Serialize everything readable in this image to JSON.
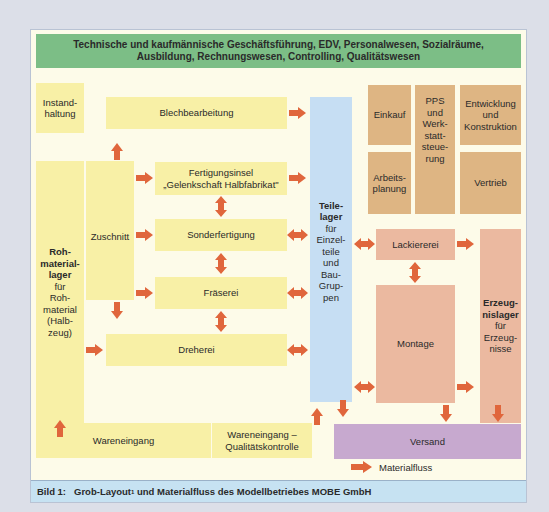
{
  "header": {
    "line1": "Technische und kaufmännische Geschäftsführung, EDV, Personalwesen, Sozialräume,",
    "line2": "Ausbildung, Rechnungswesen, Controlling, Qualitätswesen"
  },
  "boxes": {
    "instandhaltung": "Instand-\nhaltung",
    "blechbearbeitung": "Blechbearbeitung",
    "fertigungsinsel_1": "Fertigungsinsel",
    "fertigungsinsel_2": "„Gelenkschaft Halbfabrikat\"",
    "zuschnitt": "Zuschnitt",
    "sonderfertigung": "Sonderfertigung",
    "fraeserei": "Fräserei",
    "dreherei": "Dreherei",
    "rohmateriallager_bold": "Roh-\nmaterial-\nlager",
    "rohmateriallager_rest": "für\nRoh-\nmaterial\n(Halb-\nzeug)",
    "teilelager_bold": "Teile-\nlager",
    "teilelager_rest": "für\nEinzel-\nteile\nund\nBau-\nGrup-\npen",
    "einkauf": "Einkauf",
    "pps": "PPS\nund\nWerk-\nstatt-\nsteue-\nrung",
    "entwicklung": "Entwicklung\nund\nKonstruktion",
    "arbeitsplanung": "Arbeits-\nplanung",
    "vertrieb": "Vertrieb",
    "lackiererei": "Lackiererei",
    "montage": "Montage",
    "erzeugnislager_bold": "Erzeug-\nnislager",
    "erzeugnislager_rest": "für\nErzeug-\nnisse",
    "wareneingang": "Wareneingang",
    "wareneingang_qk": "Wareneingang –\nQualitätskontrolle",
    "versand": "Versand"
  },
  "legend": {
    "label": "Materialfluss"
  },
  "caption": {
    "prefix": "Bild 1:",
    "text_a": "Grob-Layout",
    "sup": "1",
    "text_b": " und Materialfluss des Modellbetriebes MOBE GmbH"
  },
  "colors": {
    "arrow": "#e0663c",
    "production": "#f8f0a6",
    "admin": "#deb583",
    "assembly": "#ebb9a0",
    "storage": "#c6def3",
    "shipping": "#c7a9cf",
    "management": "#7cbe86"
  }
}
